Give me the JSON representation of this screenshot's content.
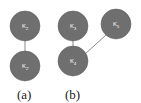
{
  "diagram": {
    "colors": {
      "node_fill": "#6f6f6f",
      "node_stroke": "#5a5a5a",
      "edge": "#8a8a8a",
      "label": "#ffffff",
      "caption": "#222222"
    },
    "panels": [
      {
        "caption": "(a)",
        "nodes": [
          {
            "id": "a1",
            "label": "K",
            "sub": "2"
          },
          {
            "id": "a2",
            "label": "K",
            "sub": "2'"
          }
        ],
        "edges": [
          [
            "a1",
            "a2"
          ]
        ]
      },
      {
        "caption": "(b)",
        "nodes": [
          {
            "id": "b1",
            "label": "K",
            "sub": "3"
          },
          {
            "id": "b2",
            "label": "K",
            "sub": "5"
          },
          {
            "id": "b3",
            "label": "K",
            "sub": "4"
          }
        ],
        "edges": [
          [
            "b1",
            "b3"
          ],
          [
            "b3",
            "b2"
          ]
        ]
      }
    ]
  }
}
